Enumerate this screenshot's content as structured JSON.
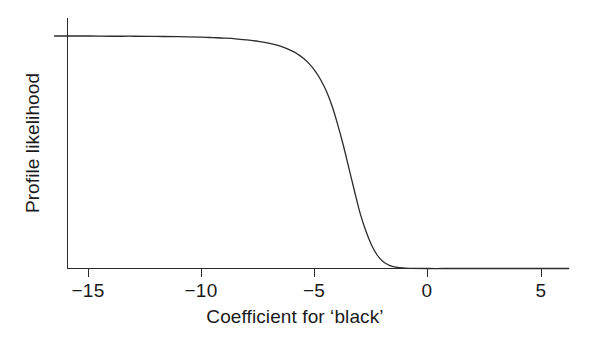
{
  "chart_data": {
    "type": "line",
    "title": "",
    "subtitle": "",
    "xlabel": "Coefficient for ‘black’",
    "ylabel": "Profile likelihood",
    "xlim": [
      -16.5,
      6.2
    ],
    "ylim": [
      0,
      1.08
    ],
    "grid": false,
    "legend": null,
    "xticks": [
      -15,
      -10,
      -5,
      0,
      5
    ],
    "xticklabels": [
      "−15",
      "−10",
      "−5",
      "0",
      "5"
    ],
    "yticks": [],
    "yticklabels": [],
    "axis_style": "L-shaped spines, ticks below x-axis only, no y-axis ticks or labels",
    "line_color": "#2b2b2b",
    "line_width": 1.3,
    "series": [
      {
        "name": "Profile likelihood",
        "x": [
          -16.5,
          -16.0,
          -15.0,
          -14.0,
          -13.0,
          -12.0,
          -11.0,
          -10.0,
          -9.5,
          -9.0,
          -8.5,
          -8.0,
          -7.5,
          -7.0,
          -6.5,
          -6.0,
          -5.75,
          -5.5,
          -5.25,
          -5.0,
          -4.75,
          -4.5,
          -4.25,
          -4.0,
          -3.75,
          -3.5,
          -3.25,
          -3.0,
          -2.75,
          -2.5,
          -2.25,
          -2.0,
          -1.75,
          -1.5,
          -1.0,
          0.0,
          1.0,
          2.0,
          3.0,
          4.0,
          5.0,
          6.2
        ],
        "y": [
          1.0,
          1.0,
          1.0,
          0.999,
          0.999,
          0.998,
          0.997,
          0.995,
          0.993,
          0.991,
          0.988,
          0.983,
          0.977,
          0.968,
          0.955,
          0.935,
          0.921,
          0.903,
          0.88,
          0.85,
          0.812,
          0.763,
          0.7,
          0.62,
          0.53,
          0.43,
          0.33,
          0.235,
          0.16,
          0.1,
          0.057,
          0.03,
          0.015,
          0.007,
          0.002,
          0.0,
          0.0,
          0.0,
          0.0,
          0.0,
          0.0,
          0.0
        ]
      }
    ],
    "annotations": []
  },
  "axes": {
    "x_title": "Coefficient for ‘black’",
    "y_title": "Profile likelihood",
    "tick_labels": [
      {
        "text": "−15",
        "value": -15
      },
      {
        "text": "−10",
        "value": -10
      },
      {
        "text": "−5",
        "value": -5
      },
      {
        "text": "0",
        "value": 0
      },
      {
        "text": "5",
        "value": 5
      }
    ]
  }
}
